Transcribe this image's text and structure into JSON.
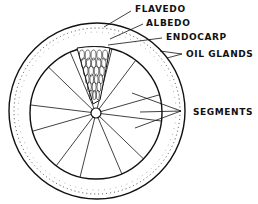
{
  "diagram": {
    "labels": {
      "flavedo": "FLAVEDO",
      "albedo": "ALBEDO",
      "endocarp": "ENDOCARP",
      "oil_glands": "OIL GLANDS",
      "segments": "SEGMENTS"
    },
    "segment_count": 12,
    "colors": {
      "ink": "#111111",
      "background": "#ffffff"
    }
  }
}
